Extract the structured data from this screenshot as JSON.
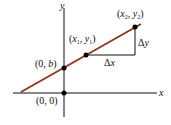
{
  "diagram": {
    "axis_labels": {
      "x": "x",
      "y": "y"
    },
    "points": {
      "origin": "(0, 0)",
      "intercept": "(0, b)",
      "p1": "(x1, y1)",
      "p2": "(x2, y2)"
    },
    "deltas": {
      "dx": "Δx",
      "dy": "Δy"
    },
    "colors": {
      "line": "#8b3a1e",
      "axis": "#111111",
      "point": "#000000"
    }
  }
}
